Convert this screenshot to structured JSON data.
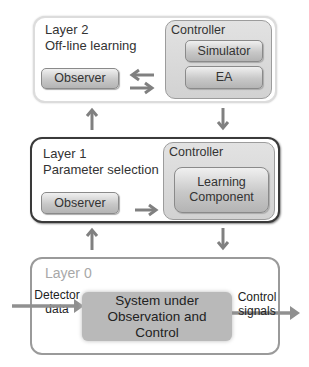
{
  "layer2": {
    "title": "Layer 2",
    "subtitle": "Off-line learning",
    "observer": "Observer",
    "controller": {
      "label": "Controller",
      "items": [
        "Simulator",
        "EA"
      ]
    }
  },
  "layer1": {
    "title": "Layer 1",
    "subtitle": "Parameter selection",
    "observer": "Observer",
    "controller": {
      "label": "Controller",
      "component_line1": "Learning",
      "component_line2": "Component"
    }
  },
  "layer0": {
    "title": "Layer 0",
    "input_line1": "Detector",
    "input_line2": "data",
    "system_line1": "System under",
    "system_line2": "Observation and",
    "system_line3": "Control",
    "output_line1": "Control",
    "output_line2": "signals"
  },
  "colors": {
    "arrow": "#808080",
    "layer1_border": "#3a3a3a",
    "layer0_title": "#a8a8a8",
    "system_fill": "#b9b9b9"
  }
}
